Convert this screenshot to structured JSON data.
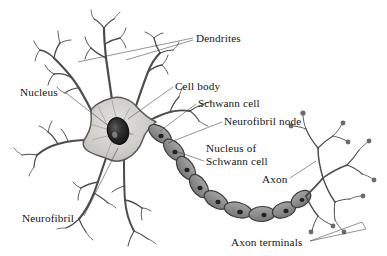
{
  "figure": {
    "type": "biological-illustration",
    "background_color": "#ffffff",
    "width": 387,
    "height": 256
  },
  "palette": {
    "background": "#ffffff",
    "soma_fill": "#c9c7c4",
    "soma_fill_light": "#dedcd9",
    "soma_stroke": "#5a5a5a",
    "nucleus_fill": "#2b2b2b",
    "nucleus_stroke": "#171717",
    "nucleolus_fill": "#6e6e6e",
    "schwann_fill": "#8f8f8f",
    "schwann_fill_dark": "#7a7a7a",
    "schwann_stroke": "#3c3c3c",
    "schwann_nucleus": "#242424",
    "dendrite_stroke": "#4c4c4c",
    "axon_stroke": "#4c4c4c",
    "terminal_bulb": "#6a6a6a",
    "label_text": "#141414",
    "leader_line": "#4a4a4a"
  },
  "labels": [
    {
      "id": "dendrites",
      "text": "Dendrites",
      "x": 196,
      "y": 42,
      "anchor": "start"
    },
    {
      "id": "cell-body",
      "text": "Cell body",
      "x": 175,
      "y": 90,
      "anchor": "start"
    },
    {
      "id": "nucleus",
      "text": "Nucleus",
      "x": 20,
      "y": 96,
      "anchor": "start"
    },
    {
      "id": "schwann-cell",
      "text": "Schwann cell",
      "x": 198,
      "y": 107,
      "anchor": "start"
    },
    {
      "id": "neurofibril-node",
      "text": "Neurofibril node",
      "x": 224,
      "y": 125,
      "anchor": "start"
    },
    {
      "id": "nucleus-of-schwann-cell-line1",
      "text": "Nucleus of",
      "x": 206,
      "y": 152,
      "anchor": "start"
    },
    {
      "id": "nucleus-of-schwann-cell-line2",
      "text": "Schwann cell",
      "x": 206,
      "y": 165,
      "anchor": "start"
    },
    {
      "id": "axon",
      "text": "Axon",
      "x": 262,
      "y": 183,
      "anchor": "start"
    },
    {
      "id": "neurofibril",
      "text": "Neurofibril",
      "x": 22,
      "y": 222,
      "anchor": "start"
    },
    {
      "id": "axon-terminals",
      "text": "Axon terminals",
      "x": 231,
      "y": 246,
      "anchor": "start"
    }
  ],
  "structures": {
    "soma": {
      "name": "Cell body (soma)",
      "shape": "multipolar star"
    },
    "nucleus": {
      "name": "Nucleus",
      "shape": "oval",
      "cx": 118,
      "cy": 131,
      "rx": 10,
      "ry": 13
    },
    "dendrite_count": 6,
    "schwann_cell_count": 9,
    "axon_terminal_bulbs": 14
  }
}
